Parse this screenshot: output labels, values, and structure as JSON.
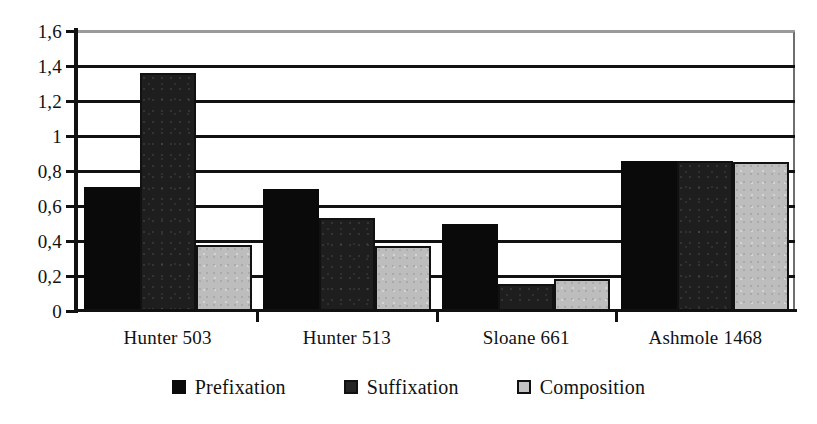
{
  "chart_data": {
    "type": "bar",
    "title": "",
    "subtitle": "",
    "xlabel": "",
    "ylabel": "",
    "categories": [
      "Hunter 503",
      "Hunter 513",
      "Sloane 661",
      "Ashmole 1468"
    ],
    "series": [
      {
        "name": "Prefixation",
        "color": "#0a0a0a",
        "values": [
          0.71,
          0.7,
          0.5,
          0.855
        ]
      },
      {
        "name": "Suffixation",
        "color": "#1e1e1e",
        "values": [
          1.36,
          0.53,
          0.155,
          0.855
        ]
      },
      {
        "name": "Composition",
        "color": "#bdbdbd",
        "values": [
          0.38,
          0.37,
          0.185,
          0.85
        ]
      }
    ],
    "ylim": [
      0,
      1.6
    ],
    "ytick_values": [
      0,
      0.2,
      0.4,
      0.6,
      0.8,
      1.0,
      1.2,
      1.4,
      1.6
    ],
    "ytick_labels": [
      "0",
      "0,2",
      "0,4",
      "0,6",
      "0,8",
      "1",
      "1,2",
      "1,4",
      "1,6"
    ],
    "grid": "horizontal",
    "legend_position": "bottom",
    "decimal_separator": ","
  },
  "legend": {
    "items": [
      {
        "label": "Prefixation",
        "swatch": "prefixation-swatch"
      },
      {
        "label": "Suffixation",
        "swatch": "suffixation-swatch"
      },
      {
        "label": "Composition",
        "swatch": "composition-swatch"
      }
    ]
  }
}
